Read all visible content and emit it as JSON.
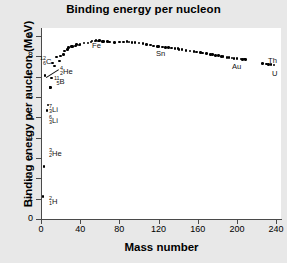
{
  "chart_data": {
    "type": "scatter",
    "title": "Binding energy per nucleon",
    "xlabel": "Mass number",
    "ylabel": "Binding energy per nucleon (MeV)",
    "xlim": [
      0,
      245
    ],
    "ylim": [
      0,
      9.4
    ],
    "xticks": [
      0,
      40,
      80,
      120,
      160,
      200,
      240
    ],
    "yticks": [
      0,
      1,
      2,
      3,
      4,
      5,
      6,
      7,
      8,
      9
    ],
    "grid": false,
    "legend": "none",
    "marker": "filled-circle",
    "marker_color": "#000000",
    "plot_background": "#ffffff",
    "figure_background": "#e8e8e8",
    "x": [
      2,
      3,
      4,
      6,
      7,
      9,
      10,
      11,
      12,
      14,
      16,
      19,
      20,
      23,
      24,
      27,
      28,
      31,
      32,
      35,
      36,
      39,
      40,
      44,
      48,
      51,
      52,
      55,
      56,
      59,
      60,
      63,
      64,
      68,
      70,
      75,
      80,
      84,
      88,
      90,
      93,
      96,
      100,
      104,
      108,
      112,
      115,
      119,
      120,
      124,
      127,
      130,
      133,
      137,
      140,
      141,
      144,
      148,
      152,
      156,
      159,
      163,
      165,
      169,
      173,
      175,
      178,
      181,
      184,
      186,
      190,
      192,
      195,
      197,
      200,
      204,
      206,
      208,
      209,
      226,
      230,
      232,
      235,
      238
    ],
    "y": [
      1.11,
      2.57,
      7.07,
      5.33,
      5.61,
      6.46,
      6.48,
      6.93,
      7.68,
      7.52,
      7.98,
      7.78,
      8.03,
      8.11,
      8.26,
      8.33,
      8.45,
      8.48,
      8.49,
      8.52,
      8.58,
      8.56,
      8.6,
      8.66,
      8.67,
      8.71,
      8.76,
      8.76,
      8.79,
      8.77,
      8.78,
      8.75,
      8.74,
      8.73,
      8.71,
      8.7,
      8.71,
      8.72,
      8.73,
      8.71,
      8.7,
      8.68,
      8.66,
      8.63,
      8.6,
      8.57,
      8.52,
      8.5,
      8.5,
      8.47,
      8.45,
      8.44,
      8.41,
      8.38,
      8.38,
      8.35,
      8.33,
      8.3,
      8.27,
      8.24,
      8.21,
      8.19,
      8.16,
      8.14,
      8.11,
      8.09,
      8.06,
      8.04,
      8.01,
      7.99,
      7.96,
      7.94,
      7.92,
      7.91,
      7.89,
      7.87,
      7.85,
      7.87,
      7.85,
      7.66,
      7.62,
      7.6,
      7.59,
      7.57
    ],
    "annotations": [
      {
        "name": "deuterium-label",
        "text_main": "H",
        "super": "2",
        "sub": "1",
        "x_px": 49,
        "y_px": 196
      },
      {
        "name": "helium3-label",
        "text_main": "He",
        "super": "3",
        "sub": "2",
        "x_px": 49,
        "y_px": 148
      },
      {
        "name": "lithium6-label",
        "text_main": "Li",
        "super": "6",
        "sub": "3",
        "x_px": 49,
        "y_px": 115
      },
      {
        "name": "lithium7-label",
        "text_main": "Li",
        "super": "7",
        "sub": "3",
        "x_px": 49,
        "y_px": 104
      },
      {
        "name": "boron11-label",
        "text_main": "B",
        "super": "11",
        "sub": "5",
        "x_px": 54,
        "y_px": 76
      },
      {
        "name": "carbon12-label",
        "text_main": "C",
        "super": "12",
        "sub": "6",
        "x_px": 40,
        "y_px": 56
      },
      {
        "name": "helium4-label",
        "text_main": "He",
        "super": "4",
        "sub": "2",
        "x_px": 60,
        "y_px": 66
      },
      {
        "name": "iron-label",
        "text_main": "Fe",
        "super": "",
        "sub": "",
        "x_px": 92,
        "y_px": 42
      },
      {
        "name": "tin-label",
        "text_main": "Sn",
        "super": "",
        "sub": "",
        "x_px": 156,
        "y_px": 50
      },
      {
        "name": "gold-label",
        "text_main": "Au",
        "super": "",
        "sub": "",
        "x_px": 232,
        "y_px": 63
      },
      {
        "name": "thorium-label",
        "text_main": "Th",
        "super": "",
        "sub": "",
        "x_px": 268,
        "y_px": 57
      },
      {
        "name": "uranium-label",
        "text_main": "U",
        "super": "",
        "sub": "",
        "x_px": 272,
        "y_px": 70
      }
    ]
  },
  "axis": {
    "y_tick_labels": [
      "0",
      "1",
      "2",
      "3",
      "4",
      "5",
      "6",
      "7",
      "8",
      "9"
    ],
    "x_tick_labels": [
      "0",
      "40",
      "80",
      "120",
      "160",
      "200",
      "240"
    ]
  }
}
